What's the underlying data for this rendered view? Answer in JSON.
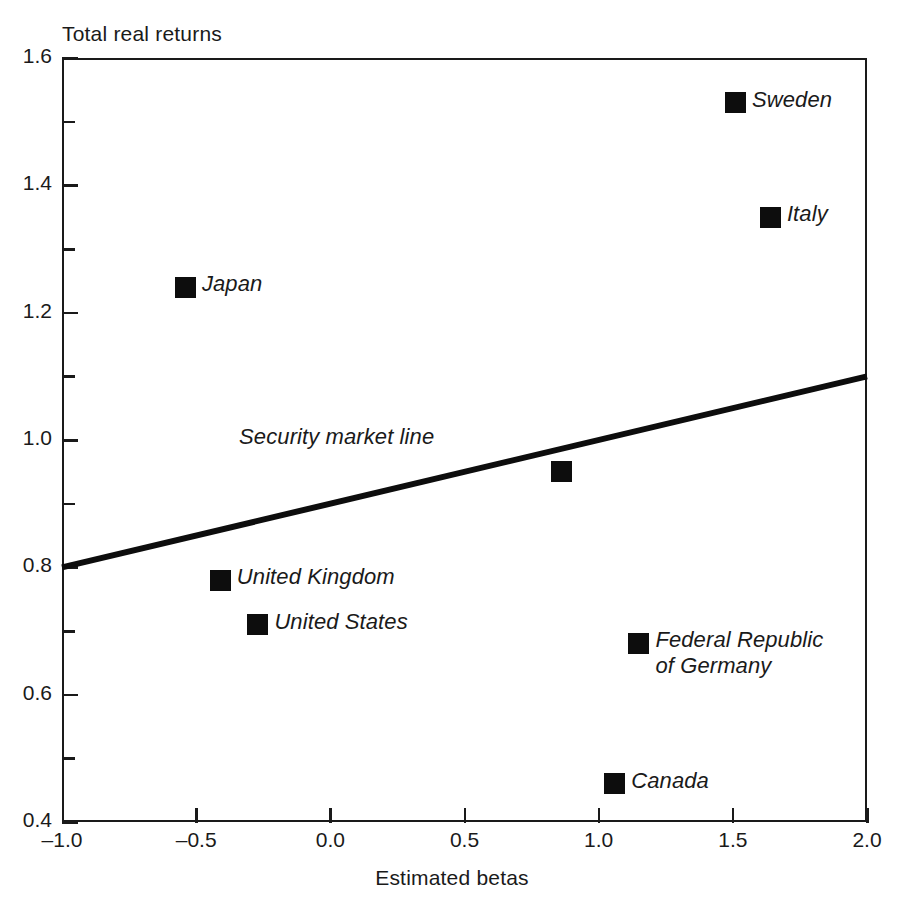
{
  "chart_data": {
    "type": "scatter",
    "title": "",
    "xlabel": "Estimated betas",
    "ylabel": "Total real returns",
    "xlim": [
      -1.0,
      2.0
    ],
    "ylim": [
      0.4,
      1.6
    ],
    "grid": false,
    "legend": "none",
    "x_ticks": [
      "-1.0",
      "-0.5",
      "0.0",
      "0.5",
      "1.0",
      "1.5",
      "2.0"
    ],
    "x_tick_values": [
      -1.0,
      -0.5,
      0.0,
      0.5,
      1.0,
      1.5,
      2.0
    ],
    "y_ticks": [
      "1.6",
      "1.4",
      "1.2",
      "1.0",
      "0.8",
      "0.6",
      "0.4"
    ],
    "y_tick_values": [
      1.6,
      1.4,
      1.2,
      1.0,
      0.8,
      0.6,
      0.4
    ],
    "y_minor_tick_values": [
      1.5,
      1.3,
      1.1,
      0.9,
      0.7,
      0.5
    ],
    "points": [
      {
        "label": "Sweden",
        "x": 1.51,
        "y": 1.53,
        "label_pos": "right",
        "lines": [
          "Sweden"
        ]
      },
      {
        "label": "Italy",
        "x": 1.64,
        "y": 1.35,
        "label_pos": "right",
        "lines": [
          "Italy"
        ]
      },
      {
        "label": "Japan",
        "x": -0.54,
        "y": 1.24,
        "label_pos": "right",
        "lines": [
          "Japan"
        ]
      },
      {
        "label": "",
        "x": 0.86,
        "y": 0.95,
        "label_pos": "none",
        "lines": []
      },
      {
        "label": "United Kingdom",
        "x": -0.41,
        "y": 0.78,
        "label_pos": "right",
        "lines": [
          "United Kingdom"
        ]
      },
      {
        "label": "United States",
        "x": -0.27,
        "y": 0.71,
        "label_pos": "right",
        "lines": [
          "United States"
        ]
      },
      {
        "label": "Federal Republic of Germany",
        "x": 1.15,
        "y": 0.68,
        "label_pos": "right",
        "lines": [
          "Federal Republic",
          "of Germany"
        ]
      },
      {
        "label": "Canada",
        "x": 1.06,
        "y": 0.46,
        "label_pos": "right",
        "lines": [
          "Canada"
        ]
      }
    ],
    "annotations": [
      {
        "name": "security-market-line",
        "text": "Security market line",
        "type": "line",
        "x0": -1.0,
        "y0": 0.8,
        "x1": 2.0,
        "y1": 1.1,
        "label_x": -0.34,
        "label_y": 1.0
      }
    ],
    "colors": {
      "marker": "#0d0d0d",
      "axis": "#1a1a1a",
      "line": "#0d0d0d",
      "background": "#ffffff"
    }
  }
}
